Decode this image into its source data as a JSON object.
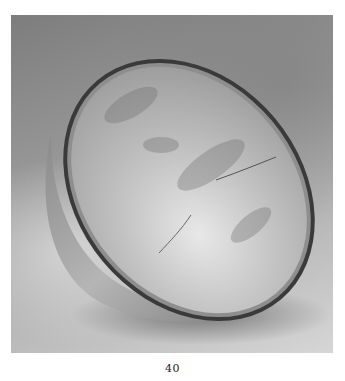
{
  "figure": {
    "tone": "grayscale",
    "caption": "40"
  }
}
